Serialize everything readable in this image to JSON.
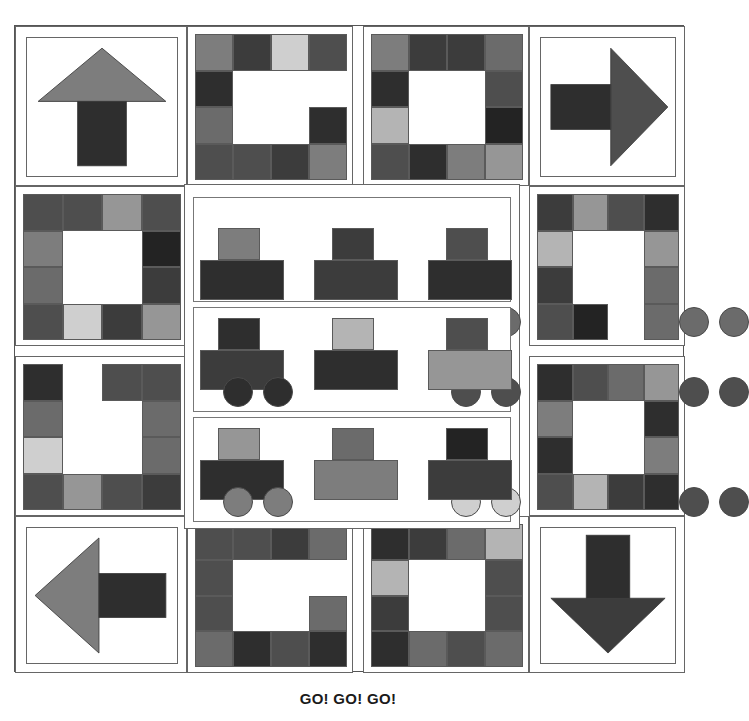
{
  "figure": {
    "title": "GO! GO! GO!",
    "caption": "GO! GO! GO!",
    "background": "#ffffff",
    "outline_color": "#555555"
  },
  "palette": {
    "white": "#ffffff",
    "near_black": "#232323",
    "very_dark_gray": "#2e2e2e",
    "dark_gray": "#3c3c3c",
    "charcoal": "#444444",
    "mid_dark_gray": "#4e4e4e",
    "medium_gray": "#6b6b6b",
    "gray": "#7d7d7d",
    "light_medium_gray": "#969696",
    "light_gray": "#b4b4b4",
    "pale_gray": "#cfcfcf",
    "very_pale_gray": "#e0e0e0"
  },
  "layout": {
    "canvas": {
      "x": 14,
      "y": 25,
      "w": 670,
      "h": 647
    },
    "description": "Nine-patch quilt layout: four corner arrow blocks, four patchwork-pair edge panels, and a central three-row train panel."
  },
  "blocks": [
    {
      "id": "top-left-arrow",
      "name": "arrow-block-up",
      "direction": "up",
      "head_color": "#7d7d7d",
      "stem_color": "#2e2e2e",
      "rect": {
        "x": 0,
        "y": 0,
        "w": 172,
        "h": 160
      }
    },
    {
      "id": "top-center-left",
      "name": "patchwork-block-1",
      "rect": {
        "x": 172,
        "y": 0,
        "w": 166,
        "h": 160
      },
      "cells": [
        [
          "#7d7d7d",
          "#3c3c3c",
          "#cfcfcf",
          "#4e4e4e"
        ],
        [
          "#2e2e2e",
          "#ffffff",
          "#ffffff",
          "#ffffff"
        ],
        [
          "#6b6b6b",
          "#ffffff",
          "#ffffff",
          "#2e2e2e"
        ],
        [
          "#4e4e4e",
          "#4e4e4e",
          "#3c3c3c",
          "#7d7d7d"
        ]
      ]
    },
    {
      "id": "top-center-right",
      "name": "patchwork-block-2",
      "rect": {
        "x": 348,
        "y": 0,
        "w": 166,
        "h": 160
      },
      "cells": [
        [
          "#7d7d7d",
          "#3c3c3c",
          "#3c3c3c",
          "#6b6b6b"
        ],
        [
          "#2e2e2e",
          "#ffffff",
          "#ffffff",
          "#4e4e4e"
        ],
        [
          "#b4b4b4",
          "#ffffff",
          "#ffffff",
          "#232323"
        ],
        [
          "#4e4e4e",
          "#2e2e2e",
          "#7d7d7d",
          "#969696"
        ]
      ]
    },
    {
      "id": "top-right-arrow",
      "name": "arrow-block-right",
      "direction": "right",
      "head_color": "#4e4e4e",
      "stem_color": "#2e2e2e",
      "rect": {
        "x": 514,
        "y": 0,
        "w": 156,
        "h": 160
      }
    },
    {
      "id": "left-upper",
      "name": "patchwork-block-3",
      "rect": {
        "x": 0,
        "y": 160,
        "w": 172,
        "h": 160
      },
      "cells": [
        [
          "#4e4e4e",
          "#4e4e4e",
          "#969696",
          "#4e4e4e"
        ],
        [
          "#7d7d7d",
          "#ffffff",
          "#ffffff",
          "#232323"
        ],
        [
          "#6b6b6b",
          "#ffffff",
          "#ffffff",
          "#3c3c3c"
        ],
        [
          "#4e4e4e",
          "#cfcfcf",
          "#3c3c3c",
          "#969696"
        ]
      ]
    },
    {
      "id": "left-lower",
      "name": "patchwork-block-4",
      "rect": {
        "x": 0,
        "y": 330,
        "w": 172,
        "h": 160
      },
      "cells": [
        [
          "#2e2e2e",
          "#ffffff",
          "#4e4e4e",
          "#4e4e4e"
        ],
        [
          "#6b6b6b",
          "#ffffff",
          "#ffffff",
          "#6b6b6b"
        ],
        [
          "#cfcfcf",
          "#ffffff",
          "#ffffff",
          "#6b6b6b"
        ],
        [
          "#4e4e4e",
          "#969696",
          "#4e4e4e",
          "#3c3c3c"
        ]
      ]
    },
    {
      "id": "right-upper",
      "name": "patchwork-block-5",
      "rect": {
        "x": 514,
        "y": 160,
        "w": 156,
        "h": 160
      },
      "cells": [
        [
          "#3c3c3c",
          "#969696",
          "#4e4e4e",
          "#2e2e2e"
        ],
        [
          "#b4b4b4",
          "#ffffff",
          "#ffffff",
          "#969696"
        ],
        [
          "#3c3c3c",
          "#ffffff",
          "#ffffff",
          "#6b6b6b"
        ],
        [
          "#4e4e4e",
          "#232323",
          "#ffffff",
          "#6b6b6b"
        ]
      ]
    },
    {
      "id": "right-lower",
      "name": "patchwork-block-6",
      "rect": {
        "x": 514,
        "y": 330,
        "w": 156,
        "h": 160
      },
      "cells": [
        [
          "#2e2e2e",
          "#4e4e4e",
          "#6b6b6b",
          "#969696"
        ],
        [
          "#7d7d7d",
          "#ffffff",
          "#ffffff",
          "#2e2e2e"
        ],
        [
          "#2e2e2e",
          "#ffffff",
          "#ffffff",
          "#7d7d7d"
        ],
        [
          "#4e4e4e",
          "#b4b4b4",
          "#3c3c3c",
          "#2e2e2e"
        ]
      ]
    },
    {
      "id": "bottom-left-arrow",
      "name": "arrow-block-left",
      "direction": "left",
      "head_color": "#7d7d7d",
      "stem_color": "#2e2e2e",
      "rect": {
        "x": 0,
        "y": 490,
        "w": 172,
        "h": 157
      }
    },
    {
      "id": "bottom-center-left",
      "name": "patchwork-block-7",
      "rect": {
        "x": 172,
        "y": 490,
        "w": 166,
        "h": 157
      },
      "cells": [
        [
          "#4e4e4e",
          "#4e4e4e",
          "#3c3c3c",
          "#6b6b6b"
        ],
        [
          "#4e4e4e",
          "#ffffff",
          "#ffffff",
          "#ffffff"
        ],
        [
          "#4e4e4e",
          "#ffffff",
          "#ffffff",
          "#6b6b6b"
        ],
        [
          "#6b6b6b",
          "#2e2e2e",
          "#4e4e4e",
          "#2e2e2e"
        ]
      ]
    },
    {
      "id": "bottom-center-right",
      "name": "patchwork-block-8",
      "rect": {
        "x": 348,
        "y": 490,
        "w": 166,
        "h": 157
      },
      "cells": [
        [
          "#2e2e2e",
          "#3c3c3c",
          "#6b6b6b",
          "#b4b4b4"
        ],
        [
          "#b4b4b4",
          "#ffffff",
          "#ffffff",
          "#4e4e4e"
        ],
        [
          "#3c3c3c",
          "#ffffff",
          "#ffffff",
          "#4e4e4e"
        ],
        [
          "#2e2e2e",
          "#6b6b6b",
          "#4e4e4e",
          "#6b6b6b"
        ]
      ]
    },
    {
      "id": "bottom-right-arrow",
      "name": "arrow-block-down",
      "direction": "down",
      "head_color": "#3c3c3c",
      "stem_color": "#2e2e2e",
      "rect": {
        "x": 514,
        "y": 490,
        "w": 156,
        "h": 157
      }
    }
  ],
  "train_panel": {
    "name": "center-train-panel",
    "rect": {
      "x": 169,
      "y": 158,
      "w": 336,
      "h": 345
    },
    "rows": [
      {
        "label": "train-row-1",
        "cars": [
          {
            "body_color": "#2e2e2e",
            "top_color": "#7d7d7d",
            "wheel_color": "#b4b4b4",
            "body": {
              "x": 6,
              "y": 62,
              "w": 84,
              "h": 40
            },
            "top": {
              "x": 24,
              "y": 30,
              "w": 42,
              "h": 32
            },
            "wheels": [
              {
                "cx": 26,
                "cy": 100
              },
              {
                "cx": 66,
                "cy": 100
              }
            ]
          },
          {
            "body_color": "#3c3c3c",
            "top_color": "#3c3c3c",
            "wheel_color": "#6b6b6b",
            "body": {
              "x": 120,
              "y": 62,
              "w": 84,
              "h": 40
            },
            "top": {
              "x": 138,
              "y": 30,
              "w": 42,
              "h": 32
            },
            "wheels": [
              {
                "cx": 140,
                "cy": 100
              },
              {
                "cx": 180,
                "cy": 100
              }
            ]
          },
          {
            "body_color": "#2e2e2e",
            "top_color": "#4e4e4e",
            "wheel_color": "#6b6b6b",
            "body": {
              "x": 234,
              "y": 62,
              "w": 84,
              "h": 40
            },
            "top": {
              "x": 252,
              "y": 30,
              "w": 42,
              "h": 32
            },
            "wheels": [
              {
                "cx": 254,
                "cy": 100
              },
              {
                "cx": 294,
                "cy": 100
              }
            ]
          }
        ]
      },
      {
        "label": "train-row-2",
        "cars": [
          {
            "body_color": "#3c3c3c",
            "top_color": "#2e2e2e",
            "wheel_color": "#2e2e2e",
            "body": {
              "x": 6,
              "y": 42,
              "w": 84,
              "h": 40
            },
            "top": {
              "x": 24,
              "y": 10,
              "w": 42,
              "h": 32
            },
            "wheels": [
              {
                "cx": 26,
                "cy": 80
              },
              {
                "cx": 66,
                "cy": 80
              }
            ]
          },
          {
            "body_color": "#2e2e2e",
            "top_color": "#b4b4b4",
            "wheel_color": "#4e4e4e",
            "body": {
              "x": 120,
              "y": 42,
              "w": 84,
              "h": 40
            },
            "top": {
              "x": 138,
              "y": 10,
              "w": 42,
              "h": 32
            },
            "wheels": [
              {
                "cx": 140,
                "cy": 80
              },
              {
                "cx": 180,
                "cy": 80
              }
            ]
          },
          {
            "body_color": "#969696",
            "top_color": "#4e4e4e",
            "wheel_color": "#4e4e4e",
            "body": {
              "x": 234,
              "y": 42,
              "w": 84,
              "h": 40
            },
            "top": {
              "x": 252,
              "y": 10,
              "w": 42,
              "h": 32
            },
            "wheels": [
              {
                "cx": 254,
                "cy": 80
              },
              {
                "cx": 294,
                "cy": 80
              }
            ]
          }
        ]
      },
      {
        "label": "train-row-3",
        "cars": [
          {
            "body_color": "#2e2e2e",
            "top_color": "#969696",
            "wheel_color": "#7d7d7d",
            "body": {
              "x": 6,
              "y": 42,
              "w": 84,
              "h": 40
            },
            "top": {
              "x": 24,
              "y": 10,
              "w": 42,
              "h": 32
            },
            "wheels": [
              {
                "cx": 26,
                "cy": 80
              },
              {
                "cx": 66,
                "cy": 80
              }
            ]
          },
          {
            "body_color": "#7d7d7d",
            "top_color": "#6b6b6b",
            "wheel_color": "#cfcfcf",
            "body": {
              "x": 120,
              "y": 42,
              "w": 84,
              "h": 40
            },
            "top": {
              "x": 138,
              "y": 10,
              "w": 42,
              "h": 32
            },
            "wheels": [
              {
                "cx": 140,
                "cy": 80
              },
              {
                "cx": 180,
                "cy": 80
              }
            ]
          },
          {
            "body_color": "#3c3c3c",
            "top_color": "#232323",
            "wheel_color": "#4e4e4e",
            "body": {
              "x": 234,
              "y": 42,
              "w": 84,
              "h": 40
            },
            "top": {
              "x": 252,
              "y": 10,
              "w": 42,
              "h": 32
            },
            "wheels": [
              {
                "cx": 254,
                "cy": 80
              },
              {
                "cx": 294,
                "cy": 80
              }
            ]
          }
        ]
      }
    ]
  }
}
